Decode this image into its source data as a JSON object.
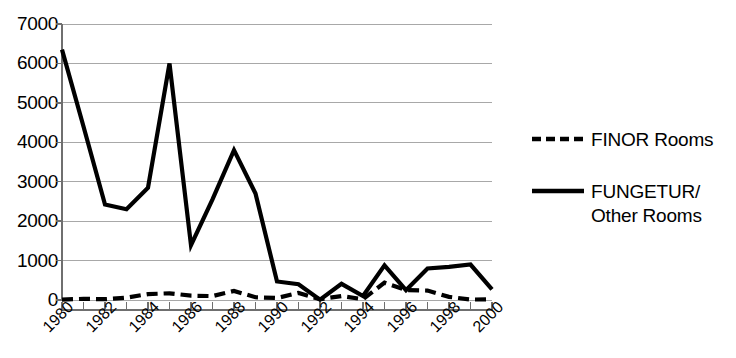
{
  "chart_data": {
    "type": "line",
    "title": "",
    "subtitle": "",
    "xlabel": "",
    "ylabel": "",
    "ylim": [
      0,
      7000
    ],
    "ytick_step": 1000,
    "yticks": [
      "7000",
      "6000",
      "5000",
      "4000",
      "3000",
      "2000",
      "1000",
      "0"
    ],
    "grid": true,
    "grid_axis": "y",
    "legend_position": "right",
    "x": [
      1980,
      1981,
      1982,
      1983,
      1984,
      1985,
      1986,
      1987,
      1988,
      1989,
      1990,
      1991,
      1992,
      1993,
      1994,
      1995,
      1996,
      1997,
      1998,
      1999,
      2000
    ],
    "xtick_labels": [
      "1980",
      "1982",
      "1984",
      "1986",
      "1988",
      "1990",
      "1992",
      "1994",
      "1996",
      "1998",
      "2000"
    ],
    "xtick_values": [
      1980,
      1982,
      1984,
      1986,
      1988,
      1990,
      1992,
      1994,
      1996,
      1998,
      2000
    ],
    "series": [
      {
        "name": "FINOR Rooms",
        "style": "dashed",
        "color": "#000000",
        "values": [
          10,
          30,
          20,
          60,
          150,
          170,
          110,
          100,
          230,
          70,
          50,
          180,
          20,
          100,
          20,
          440,
          250,
          240,
          80,
          10,
          20
        ]
      },
      {
        "name": "FUNGETUR/ Other Rooms",
        "style": "solid",
        "color": "#000000",
        "values": [
          6350,
          4400,
          2420,
          2300,
          2850,
          6000,
          1390,
          2550,
          3800,
          2700,
          470,
          400,
          10,
          410,
          100,
          880,
          250,
          800,
          840,
          900,
          270
        ]
      }
    ]
  },
  "legend": {
    "items": [
      {
        "label": "FINOR Rooms",
        "label_line2": "",
        "style": "dashed"
      },
      {
        "label": "FUNGETUR/",
        "label_line2": "Other Rooms",
        "style": "solid"
      }
    ]
  },
  "colors": {
    "line": "#000000",
    "grid": "#a8a8a8",
    "axis": "#6f6f6f",
    "background": "#ffffff"
  }
}
